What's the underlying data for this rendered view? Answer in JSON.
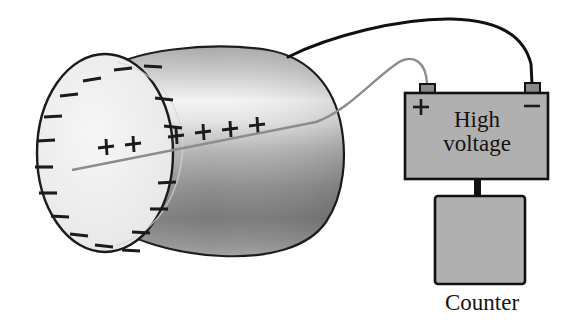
{
  "figure": {
    "background_color": "#ffffff"
  },
  "labels": {
    "high_voltage": "High\nvoltage",
    "high_voltage_line1": "High",
    "high_voltage_line2": "voltage",
    "counter": "Counter"
  },
  "battery": {
    "fill_color": "#b0b0b0",
    "stroke_color": "#111111",
    "positive_terminal_label": "+",
    "negative_terminal_label": "−",
    "terminal_fill": "#8a8a8a",
    "x": 405,
    "y": 93,
    "width": 143,
    "height": 86
  },
  "counter_box": {
    "fill_color": "#b0b0b0",
    "stroke_color": "#111111",
    "x": 435,
    "y": 196,
    "width": 90,
    "height": 88
  },
  "cylinder": {
    "description": "gas-filled metal tube shown as a shaded cylinder",
    "body_light": "#f3f3f3",
    "body_mid": "#a8a8a8",
    "body_dark": "#6e6e6e",
    "end_face_fill": "#eeeeee",
    "stroke_color": "#1b1b1b"
  },
  "charges": {
    "positive_symbol": "+",
    "negative_symbol": "−",
    "positive_count": 6,
    "negative_count": 18,
    "positive_positions": [
      {
        "x": 106,
        "y": 146
      },
      {
        "x": 133,
        "y": 143
      },
      {
        "x": 176,
        "y": 135
      },
      {
        "x": 203,
        "y": 132
      },
      {
        "x": 230,
        "y": 128
      },
      {
        "x": 257,
        "y": 125
      }
    ],
    "negative_positions": [
      {
        "x": 92,
        "y": 83
      },
      {
        "x": 122,
        "y": 73
      },
      {
        "x": 70,
        "y": 96
      },
      {
        "x": 55,
        "y": 117
      },
      {
        "x": 47,
        "y": 141
      },
      {
        "x": 45,
        "y": 166
      },
      {
        "x": 50,
        "y": 190
      },
      {
        "x": 62,
        "y": 212
      },
      {
        "x": 80,
        "y": 230
      },
      {
        "x": 104,
        "y": 243
      },
      {
        "x": 130,
        "y": 249
      },
      {
        "x": 148,
        "y": 238
      },
      {
        "x": 147,
        "y": 110
      },
      {
        "x": 153,
        "y": 97
      },
      {
        "x": 136,
        "y": 182
      },
      {
        "x": 140,
        "y": 207
      },
      {
        "x": 132,
        "y": 226
      },
      {
        "x": 124,
        "y": 163
      }
    ]
  },
  "wires": {
    "anode_wire": {
      "color": "#8c8c8c",
      "connects": "central anode wire to positive terminal"
    },
    "cathode_wire": {
      "color": "#111111",
      "connects": "cylinder wall to negative terminal"
    },
    "counter_lead": {
      "color": "#111111",
      "connects": "high voltage supply to counter"
    }
  }
}
